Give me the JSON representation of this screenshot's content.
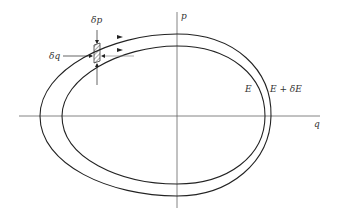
{
  "figure": {
    "type": "phase-space diagram",
    "axes": {
      "horizontal": "q",
      "vertical": "p"
    },
    "curves": [
      {
        "id": "inner",
        "label": "E"
      },
      {
        "id": "outer",
        "label": "E + δE"
      }
    ],
    "annotations": {
      "delta_p": "δp",
      "delta_q": "δq"
    },
    "colors": {
      "line": "#222222",
      "axis": "#555555",
      "background": "#ffffff"
    }
  }
}
